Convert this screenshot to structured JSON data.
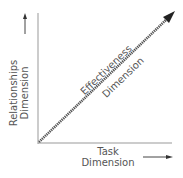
{
  "diagram": {
    "type": "axes-with-diagonal-arrow",
    "y_axis": {
      "line1": "Relationships",
      "line2": "Dimension"
    },
    "x_axis": {
      "line1": "Task",
      "line2": "Dimension"
    },
    "diagonal": {
      "line1": "Effectiveness",
      "line2": "Dimension"
    },
    "colors": {
      "axis": "#888888",
      "arrow": "#444444",
      "text": "#555555"
    }
  }
}
